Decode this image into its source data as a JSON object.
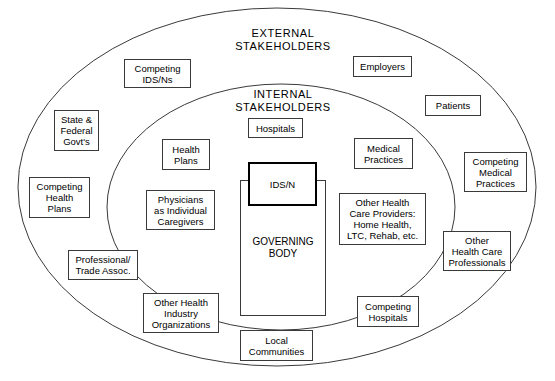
{
  "diagram": {
    "type": "venn-concentric-ellipse-stakeholder-map",
    "background": "#ffffff",
    "line_color": "#3a3a3a",
    "core_border_color": "#000000",
    "rings": [
      {
        "id": "external",
        "label": "EXTERNAL\nSTAKEHOLDERS",
        "cx": 277,
        "cy": 187,
        "rx": 259,
        "ry": 179,
        "label_x": 283,
        "label_y": 27
      },
      {
        "id": "internal",
        "label": "INTERNAL\nSTAKEHOLDERS",
        "cx": 281,
        "cy": 207,
        "rx": 174,
        "ry": 123,
        "label_x": 283,
        "label_y": 88
      }
    ],
    "core": {
      "label": "IDS/N",
      "x": 248,
      "y": 162,
      "w": 69,
      "h": 44
    },
    "governing_body": {
      "label": "GOVERNING\nBODY",
      "x": 240,
      "y": 180,
      "w": 86,
      "h": 136,
      "label_x": 283,
      "label_y": 242
    },
    "nodes": [
      {
        "id": "competing-ids-ns",
        "label": "Competing\nIDS/Ns",
        "ring": "external",
        "x": 124,
        "y": 59,
        "w": 67,
        "h": 29
      },
      {
        "id": "employers",
        "label": "Employers",
        "ring": "external",
        "x": 353,
        "y": 56,
        "w": 59,
        "h": 21
      },
      {
        "id": "patients",
        "label": "Patients",
        "ring": "external",
        "x": 425,
        "y": 95,
        "w": 56,
        "h": 21
      },
      {
        "id": "state-federal-govts",
        "label": "State &\nFederal\nGovt's",
        "ring": "external",
        "x": 54,
        "y": 110,
        "w": 45,
        "h": 41
      },
      {
        "id": "competing-medical-practices",
        "label": "Competing\nMedical\nPractices",
        "ring": "external",
        "x": 464,
        "y": 152,
        "w": 63,
        "h": 40
      },
      {
        "id": "competing-health-plans",
        "label": "Competing\nHealth\nPlans",
        "ring": "external",
        "x": 29,
        "y": 177,
        "w": 61,
        "h": 41
      },
      {
        "id": "other-health-care-professionals",
        "label": "Other\nHealth Care\nProfessionals",
        "ring": "external",
        "x": 443,
        "y": 231,
        "w": 68,
        "h": 40
      },
      {
        "id": "professional-trade-assoc",
        "label": "Professional/\nTrade Assoc.",
        "ring": "external",
        "x": 68,
        "y": 250,
        "w": 70,
        "h": 30
      },
      {
        "id": "hospitals",
        "label": "Hospitals",
        "ring": "internal",
        "x": 248,
        "y": 118,
        "w": 55,
        "h": 20
      },
      {
        "id": "health-plans",
        "label": "Health\nPlans",
        "ring": "internal",
        "x": 162,
        "y": 139,
        "w": 48,
        "h": 31
      },
      {
        "id": "medical-practices",
        "label": "Medical\nPractices",
        "ring": "internal",
        "x": 354,
        "y": 138,
        "w": 59,
        "h": 31
      },
      {
        "id": "physicians-as-individual-caregivers",
        "label": "Physicians\nas Individual\nCaregivers",
        "ring": "internal",
        "x": 146,
        "y": 190,
        "w": 69,
        "h": 40
      },
      {
        "id": "other-health-care-providers",
        "label": "Other Health\nCare Providers:\nHome Health,\nLTC, Rehab, etc.",
        "ring": "internal",
        "x": 339,
        "y": 193,
        "w": 87,
        "h": 52
      },
      {
        "id": "other-health-industry-organizations",
        "label": "Other Health\nIndustry\nOrganizations",
        "ring": "internal",
        "x": 143,
        "y": 293,
        "w": 76,
        "h": 40
      },
      {
        "id": "competing-hospitals",
        "label": "Competing\nHospitals",
        "ring": "internal",
        "x": 357,
        "y": 296,
        "w": 62,
        "h": 31
      },
      {
        "id": "local-communities",
        "label": "Local\nCommunities",
        "ring": "internal",
        "x": 240,
        "y": 330,
        "w": 73,
        "h": 31
      }
    ]
  }
}
